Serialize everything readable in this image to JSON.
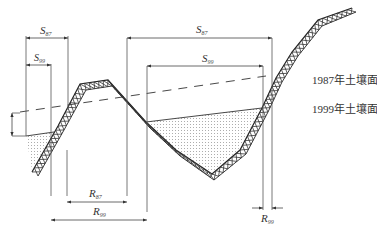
{
  "diagram": {
    "type": "cross-section",
    "legend": {
      "surface_1987": "1987年土壤面",
      "surface_1999": "1999年土壤面"
    },
    "dimensions": {
      "S87_left": {
        "base": "S",
        "sub": "87"
      },
      "S99_left": {
        "base": "S",
        "sub": "99"
      },
      "S87_right": {
        "base": "S",
        "sub": "87"
      },
      "S99_right": {
        "base": "S",
        "sub": "99"
      },
      "R87": {
        "base": "R",
        "sub": "87"
      },
      "R99_bottom": {
        "base": "R",
        "sub": "99"
      },
      "R99_right": {
        "base": "R",
        "sub": "99"
      }
    }
  }
}
